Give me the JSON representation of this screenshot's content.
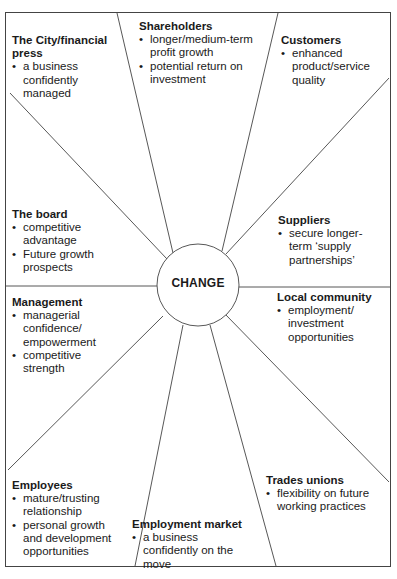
{
  "diagram": {
    "center": {
      "label": "CHANGE"
    },
    "stakeholders": [
      {
        "id": "city",
        "title": "The City/financial press",
        "points": [
          "a business confidently managed"
        ]
      },
      {
        "id": "shareholders",
        "title": "Shareholders",
        "points": [
          "longer/medium-term profit growth",
          "potential return on investment"
        ]
      },
      {
        "id": "customers",
        "title": "Customers",
        "points": [
          "enhanced product/service quality"
        ]
      },
      {
        "id": "board",
        "title": "The board",
        "points": [
          "competitive advantage",
          "Future growth prospects"
        ]
      },
      {
        "id": "suppliers",
        "title": "Suppliers",
        "points": [
          "secure longer-term ‘supply partnerships’"
        ]
      },
      {
        "id": "management",
        "title": "Management",
        "points": [
          "managerial confidence/ empowerment",
          "competitive strength"
        ]
      },
      {
        "id": "local-community",
        "title": "Local community",
        "points": [
          "employment/ investment opportunities"
        ]
      },
      {
        "id": "employees",
        "title": "Employees",
        "points": [
          "mature/trusting relationship",
          "personal growth and development opportunities"
        ]
      },
      {
        "id": "employment-market",
        "title": "Employment market",
        "points": [
          "a business confidently on the move"
        ]
      },
      {
        "id": "trades-unions",
        "title": "Trades unions",
        "points": [
          "flexibility on future working practices"
        ]
      }
    ],
    "colors": {
      "line": "#444444",
      "text": "#1a1a1a",
      "background": "#ffffff"
    }
  }
}
